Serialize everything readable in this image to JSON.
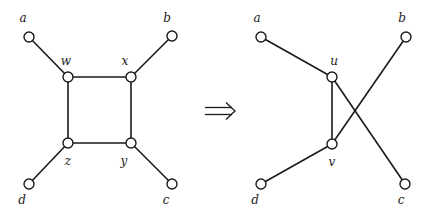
{
  "diagram": {
    "type": "graph-transformation",
    "arrow_symbol": "⇒",
    "left_graph": {
      "nodes": [
        {
          "id": "a",
          "label": "a",
          "x": 29,
          "y": 37,
          "lx": 23,
          "ly": 22
        },
        {
          "id": "b",
          "label": "b",
          "x": 172,
          "y": 36,
          "lx": 167,
          "ly": 22
        },
        {
          "id": "w",
          "label": "w",
          "x": 68,
          "y": 77,
          "lx": 66,
          "ly": 65
        },
        {
          "id": "x",
          "label": "x",
          "x": 131,
          "y": 77,
          "lx": 125,
          "ly": 65
        },
        {
          "id": "z",
          "label": "z",
          "x": 68,
          "y": 143,
          "lx": 68,
          "ly": 165
        },
        {
          "id": "y",
          "label": "y",
          "x": 131,
          "y": 143,
          "lx": 124,
          "ly": 165
        },
        {
          "id": "d",
          "label": "d",
          "x": 29,
          "y": 184,
          "lx": 22,
          "ly": 204
        },
        {
          "id": "c",
          "label": "c",
          "x": 172,
          "y": 184,
          "lx": 166,
          "ly": 204
        }
      ],
      "edges": [
        [
          "a",
          "w"
        ],
        [
          "b",
          "x"
        ],
        [
          "w",
          "x"
        ],
        [
          "w",
          "z"
        ],
        [
          "x",
          "y"
        ],
        [
          "z",
          "y"
        ],
        [
          "z",
          "d"
        ],
        [
          "y",
          "c"
        ]
      ]
    },
    "right_graph": {
      "nodes": [
        {
          "id": "a",
          "label": "a",
          "x": 261,
          "y": 37,
          "lx": 257,
          "ly": 22
        },
        {
          "id": "b",
          "label": "b",
          "x": 406,
          "y": 37,
          "lx": 402,
          "ly": 22
        },
        {
          "id": "u",
          "label": "u",
          "x": 332,
          "y": 77,
          "lx": 334,
          "ly": 65
        },
        {
          "id": "v",
          "label": "v",
          "x": 332,
          "y": 144,
          "lx": 332,
          "ly": 166
        },
        {
          "id": "d",
          "label": "d",
          "x": 261,
          "y": 184,
          "lx": 255,
          "ly": 204
        },
        {
          "id": "c",
          "label": "c",
          "x": 405,
          "y": 184,
          "lx": 401,
          "ly": 204
        }
      ],
      "edges": [
        [
          "a",
          "u"
        ],
        [
          "u",
          "v"
        ],
        [
          "u",
          "c"
        ],
        [
          "v",
          "b"
        ],
        [
          "v",
          "d"
        ]
      ]
    }
  }
}
